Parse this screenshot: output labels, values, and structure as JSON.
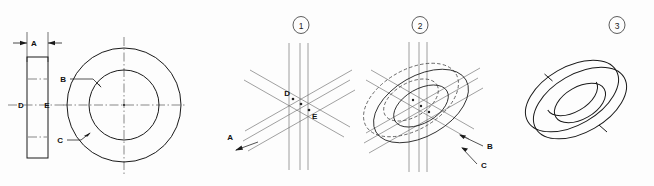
{
  "figure": {
    "background_color": "#fdfdfd",
    "line_color": "#1a1a1a",
    "construction_line_color": "#6e6e6e",
    "center_line_color": "#555555",
    "hidden_line_color": "#4a4a4a"
  },
  "ortho_view": {
    "name": "orthographic-views",
    "side_view": {
      "name": "side-rectangle-view",
      "thickness_label": "A",
      "center_left_label": "D",
      "center_right_label": "E"
    },
    "front_view": {
      "name": "front-circle-view",
      "inner_circle_label": "B",
      "outer_circle_label": "C"
    }
  },
  "steps": [
    {
      "number": "1",
      "name": "step-1-construction-grid",
      "labels": [
        "A",
        "D",
        "E"
      ],
      "caption_labels": {
        "thickness": "A",
        "front_center": "D",
        "rear_center": "E"
      }
    },
    {
      "number": "2",
      "name": "step-2-ellipses",
      "labels": [
        "B",
        "C"
      ],
      "caption_labels": {
        "inner_ellipse": "B",
        "outer_ellipse": "C"
      }
    },
    {
      "number": "3",
      "name": "step-3-finished-ring",
      "labels": []
    }
  ]
}
